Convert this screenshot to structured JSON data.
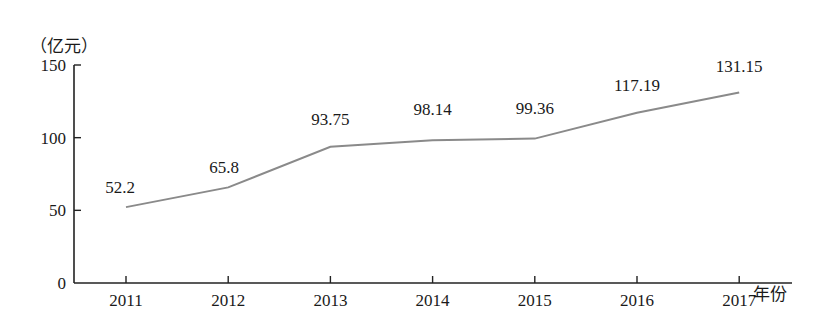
{
  "chart_data": {
    "type": "line",
    "title": "",
    "ylabel": "（亿元）",
    "xlabel": "年份",
    "categories": [
      "2011",
      "2012",
      "2013",
      "2014",
      "2015",
      "2016",
      "2017"
    ],
    "series": [
      {
        "name": "value",
        "values": [
          52.2,
          65.8,
          93.75,
          98.14,
          99.36,
          117.19,
          131.15
        ],
        "labels": [
          "52.2",
          "65.8",
          "93.75",
          "98.14",
          "99.36",
          "117.19",
          "131.15"
        ],
        "color": "#8a8a8a"
      }
    ],
    "yticks": [
      0,
      50,
      100,
      150
    ],
    "ylim": [
      0,
      150
    ],
    "grid": false,
    "legend": "none"
  }
}
